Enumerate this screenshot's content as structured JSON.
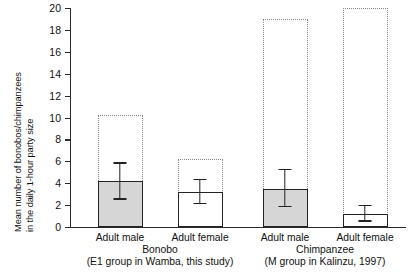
{
  "chart_data": {
    "type": "bar",
    "title": "",
    "subtitle": "",
    "xlabel": "",
    "ylabel": "Mean number of bonobos/chimpanzees in the daily 1-hour party size",
    "ylabel_lines": [
      "Mean number of bonobos/chimpanzees",
      "in the daily 1-hour party size"
    ],
    "ylim": [
      0,
      20
    ],
    "ytick_values": [
      0,
      2,
      4,
      6,
      8,
      10,
      12,
      14,
      16,
      18,
      20
    ],
    "ytick_labels": [
      "0",
      "2",
      "4",
      "6",
      "8",
      "10",
      "12",
      "14",
      "16",
      "18",
      "20"
    ],
    "grid": false,
    "legend": null,
    "categories": [
      "Adult male",
      "Adult female",
      "Adult male",
      "Adult female"
    ],
    "values": [
      4.2,
      3.2,
      3.5,
      1.2
    ],
    "err_low": [
      2.5,
      2.1,
      1.8,
      0.5
    ],
    "err_high": [
      5.8,
      4.3,
      5.2,
      1.9
    ],
    "max_range_top": [
      10.2,
      6.2,
      19.0,
      20.0
    ],
    "bar_fill": [
      "gray",
      "white",
      "gray",
      "white"
    ],
    "colors": {
      "bar_gray": "#d6d6d6",
      "bar_white": "#ffffff",
      "bar_outline": "#232323",
      "dotted_box": "#8a8a8a",
      "axis": "#2b2b2b",
      "text": "#111111"
    },
    "groups": [
      {
        "name": "Bonobo",
        "sub": "(E1 group in Wamba, this study)",
        "bars": [
          "Adult male",
          "Adult female"
        ]
      },
      {
        "name": "Chimpanzee",
        "sub": "(M group in Kalinzu, 1997)",
        "bars": [
          "Adult male",
          "Adult female"
        ]
      }
    ],
    "annotations": [
      "Dotted boxes indicate the maximum party size range",
      "Solid bars indicate mean party size with error bars"
    ]
  },
  "axis": {
    "y_title_line1": "Mean number of bonobos/chimpanzees",
    "y_title_line2": "in the daily 1-hour party size"
  },
  "ticks": {
    "y": [
      "20",
      "18",
      "16",
      "14",
      "12",
      "10",
      "8",
      "6",
      "4",
      "2",
      "0"
    ]
  },
  "bars": [
    {
      "label": "Adult male",
      "value": 4.2,
      "low": 2.5,
      "high": 5.8,
      "max": 10.2,
      "fill": "gray"
    },
    {
      "label": "Adult female",
      "value": 3.2,
      "low": 2.1,
      "high": 4.3,
      "max": 6.2,
      "fill": "white"
    },
    {
      "label": "Adult male",
      "value": 3.5,
      "low": 1.8,
      "high": 5.2,
      "max": 19.0,
      "fill": "gray"
    },
    {
      "label": "Adult female",
      "value": 1.2,
      "low": 0.5,
      "high": 1.9,
      "max": 20.0,
      "fill": "white"
    }
  ],
  "groups": [
    {
      "name": "Bonobo",
      "sub": "(E1 group in Wamba, this study)"
    },
    {
      "name": "Chimpanzee",
      "sub": "(M group in Kalinzu, 1997)"
    }
  ]
}
